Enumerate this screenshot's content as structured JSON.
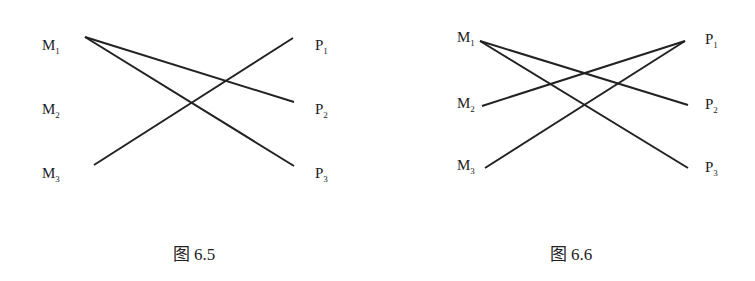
{
  "figures": [
    {
      "caption": "图 6.5",
      "left_nodes": [
        {
          "letter": "M",
          "sub": "1"
        },
        {
          "letter": "M",
          "sub": "2"
        },
        {
          "letter": "M",
          "sub": "3"
        }
      ],
      "right_nodes": [
        {
          "letter": "P",
          "sub": "1"
        },
        {
          "letter": "P",
          "sub": "2"
        },
        {
          "letter": "P",
          "sub": "3"
        }
      ],
      "edges": [
        [
          "M1",
          "P2"
        ],
        [
          "M1",
          "P3"
        ],
        [
          "M3",
          "P1"
        ]
      ]
    },
    {
      "caption": "图 6.6",
      "left_nodes": [
        {
          "letter": "M",
          "sub": "1"
        },
        {
          "letter": "M",
          "sub": "2"
        },
        {
          "letter": "M",
          "sub": "3"
        }
      ],
      "right_nodes": [
        {
          "letter": "P",
          "sub": "1"
        },
        {
          "letter": "P",
          "sub": "2"
        },
        {
          "letter": "P",
          "sub": "3"
        }
      ],
      "edges": [
        [
          "M1",
          "P2"
        ],
        [
          "M1",
          "P3"
        ],
        [
          "M2",
          "P1"
        ],
        [
          "M3",
          "P1"
        ]
      ]
    }
  ]
}
